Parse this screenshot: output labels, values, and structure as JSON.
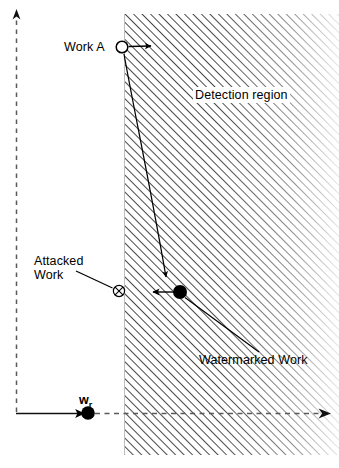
{
  "figure": {
    "background_color": "#ffffff",
    "ink_color": "#000000",
    "hatch_color": "#1a1a1a",
    "axis_color": "#555555",
    "width": 339,
    "height": 468
  },
  "labels": {
    "work_a": "Work A",
    "detection_region": "Detection region",
    "attacked_work": "Attacked\nWork",
    "watermarked_work": "Watermarked Work",
    "reference_vector": "w",
    "reference_vector_subscript": "r"
  },
  "markers": {
    "work_a": {
      "kind": "open-circle",
      "x": 122,
      "y": 47,
      "r": 6
    },
    "attacked_work": {
      "kind": "circle-times",
      "x": 119,
      "y": 291,
      "r": 6
    },
    "watermarked_work": {
      "kind": "filled-dot",
      "x": 180,
      "y": 292,
      "r": 7
    },
    "reference_vector": {
      "kind": "filled-dot",
      "x": 88,
      "y": 413,
      "r": 7
    }
  },
  "region": {
    "name": "detection-region",
    "left_boundary_x": 124,
    "top_y": 14,
    "bottom_y": 455,
    "right_x": 339,
    "fade": "right-to-left-lightening",
    "hatch_angle_deg": 45,
    "hatch_spacing_px": 6
  },
  "axes": {
    "vertical": {
      "style": "dashed",
      "x": 16,
      "from_y": 413,
      "to_y": 10,
      "arrow": "up"
    },
    "horizontal": {
      "style": "solid-then-dashed",
      "y": 413,
      "from_x": 16,
      "to_x": 331,
      "arrow": "right",
      "solid_until_x": 88
    }
  },
  "connectors": {
    "work_a_arrow": {
      "from_x": 129,
      "from_y": 47,
      "to_x": 156,
      "to_y": 46,
      "arrow": "right"
    },
    "work_a_to_watermark_curve": {
      "from_x": 124,
      "from_y": 53,
      "to_x": 167,
      "to_y": 285,
      "arrow": "down"
    },
    "watermark_to_attacked_arrow": {
      "from_x": 173,
      "from_y": 292,
      "to_x": 150,
      "to_y": 292,
      "arrow": "left"
    },
    "attacked_leader": {
      "from_x": 76,
      "from_y": 272,
      "to_x": 112,
      "to_y": 288
    },
    "watermarked_leader": {
      "from_x": 185,
      "from_y": 297,
      "to_x": 259,
      "to_y": 352
    }
  }
}
